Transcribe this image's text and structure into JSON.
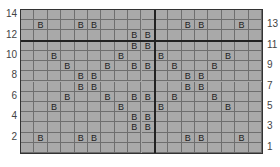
{
  "chart_data": {
    "type": "table",
    "title": "",
    "columns": 18,
    "rows": 14,
    "row_labels_left": [
      "14",
      "12",
      "10",
      "8",
      "6",
      "4",
      "2"
    ],
    "row_labels_right": [
      "13",
      "11",
      "9",
      "7",
      "5",
      "3",
      "1"
    ],
    "symbol": "B",
    "cells_by_row": {
      "14": [],
      "13": [
        2,
        5,
        6,
        13,
        14,
        17
      ],
      "12": [
        9,
        10
      ],
      "11": [
        9,
        10
      ],
      "10": [
        3,
        8,
        11,
        16
      ],
      "9": [
        4,
        7,
        9,
        10,
        12,
        15
      ],
      "8": [
        5,
        6,
        13,
        14
      ],
      "7": [
        5,
        6,
        13,
        14
      ],
      "6": [
        4,
        7,
        9,
        10,
        12,
        15
      ],
      "5": [
        3,
        8,
        11,
        16
      ],
      "4": [
        9,
        10
      ],
      "3": [
        9,
        10
      ],
      "2": [
        2,
        5,
        6,
        13,
        14,
        17
      ],
      "1": []
    },
    "thick_lines": {
      "vertical_after_col": 10,
      "horizontal_between_rows": [
        10,
        11
      ]
    }
  }
}
